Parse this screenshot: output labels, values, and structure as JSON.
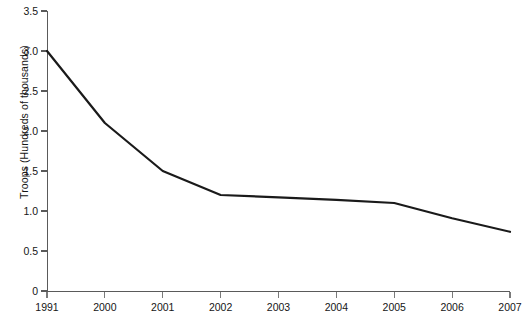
{
  "chart_data": {
    "type": "line",
    "title": "",
    "subtitle": "",
    "xlabel": "",
    "ylabel": "Troops (Hundreds of thousands)",
    "categories": [
      "1991",
      "2000",
      "2001",
      "2002",
      "2003",
      "2004",
      "2005",
      "2006",
      "2007"
    ],
    "series": [
      {
        "name": "Troops",
        "values": [
          3.0,
          2.1,
          1.5,
          1.2,
          1.17,
          1.14,
          1.1,
          0.91,
          0.74
        ]
      }
    ],
    "ylim": [
      0,
      3.5
    ],
    "y_ticks": [
      0,
      0.5,
      1.0,
      1.5,
      2.0,
      2.5,
      3.0,
      3.5
    ],
    "y_tick_labels": [
      "0",
      "0.5",
      "1.0",
      "1.5",
      "2.0",
      "2.5",
      "3.0",
      "3.5"
    ],
    "x_tick_labels": [
      "1991",
      "2000",
      "2001",
      "2002",
      "2003",
      "2004",
      "2005",
      "2006",
      "2007"
    ],
    "grid": false,
    "legend": null,
    "legend_position": "none",
    "line_color": "#1a1a1a",
    "axis_color": "#5a5a5a",
    "background_color": "#ffffff"
  }
}
